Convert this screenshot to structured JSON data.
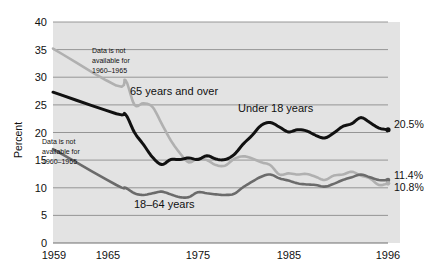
{
  "chart_data": {
    "type": "line",
    "title": "",
    "xlabel": "",
    "ylabel": "Percent",
    "xlim": [
      1959,
      1996
    ],
    "ylim": [
      0,
      40
    ],
    "ytick_step": 5,
    "grid": "horizontal",
    "legend": "inline-labels",
    "yticks": [
      "0",
      "5",
      "10",
      "15",
      "20",
      "25",
      "30",
      "35",
      "40"
    ],
    "xticks": [
      "1959",
      "1965",
      "1975",
      "1985",
      "1996"
    ],
    "colors": {
      "under18": "#111111",
      "age18to64": "#6b6b6b",
      "age65plus": "#b0b0b0",
      "plot_background": "#e3e3e3",
      "gridline": "#8c8c8c"
    },
    "series": [
      {
        "name": "Under 18 years",
        "color": "#111111",
        "end_value_label": "20.5%",
        "x": [
          1959,
          1966,
          1967,
          1968,
          1969,
          1970,
          1971,
          1972,
          1973,
          1974,
          1975,
          1976,
          1977,
          1978,
          1979,
          1980,
          1981,
          1982,
          1983,
          1984,
          1985,
          1986,
          1987,
          1988,
          1989,
          1990,
          1991,
          1992,
          1993,
          1994,
          1995,
          1996
        ],
        "values": [
          27.3,
          23.4,
          23.3,
          20.0,
          17.8,
          15.5,
          14.2,
          15.1,
          15.1,
          15.4,
          15.1,
          15.8,
          15.2,
          15.1,
          16.0,
          17.9,
          19.5,
          21.3,
          21.8,
          21.0,
          20.1,
          20.5,
          20.3,
          19.5,
          19.0,
          19.9,
          21.1,
          21.6,
          22.7,
          21.8,
          20.8,
          20.5
        ]
      },
      {
        "name": "18–64 years",
        "color": "#6b6b6b",
        "end_value_label": "11.4%",
        "x": [
          1959,
          1966,
          1967,
          1968,
          1969,
          1970,
          1971,
          1972,
          1973,
          1974,
          1975,
          1976,
          1977,
          1978,
          1979,
          1980,
          1981,
          1982,
          1983,
          1984,
          1985,
          1986,
          1987,
          1988,
          1989,
          1990,
          1991,
          1992,
          1993,
          1994,
          1995,
          1996
        ],
        "values": [
          17.0,
          10.5,
          10.0,
          9.0,
          8.7,
          9.0,
          9.3,
          8.8,
          8.3,
          8.3,
          9.2,
          9.0,
          8.8,
          8.7,
          8.9,
          10.1,
          11.1,
          12.0,
          12.4,
          11.7,
          11.3,
          10.8,
          10.6,
          10.5,
          10.2,
          10.7,
          11.4,
          11.9,
          12.4,
          11.9,
          11.4,
          11.4
        ]
      },
      {
        "name": "65 years and over",
        "color": "#b0b0b0",
        "end_value_label": "10.8%",
        "x": [
          1959,
          1966,
          1967,
          1968,
          1969,
          1970,
          1971,
          1972,
          1973,
          1974,
          1975,
          1976,
          1977,
          1978,
          1979,
          1980,
          1981,
          1982,
          1983,
          1984,
          1985,
          1986,
          1987,
          1988,
          1989,
          1990,
          1991,
          1992,
          1993,
          1994,
          1995,
          1996
        ],
        "values": [
          35.2,
          28.5,
          29.5,
          25.0,
          25.3,
          24.6,
          21.6,
          18.6,
          16.3,
          14.6,
          15.3,
          15.0,
          14.1,
          14.0,
          15.2,
          15.7,
          15.3,
          14.6,
          14.1,
          12.4,
          12.6,
          12.4,
          12.5,
          12.0,
          11.4,
          12.2,
          12.4,
          12.9,
          12.2,
          11.7,
          10.5,
          10.8
        ]
      }
    ],
    "annotations": [
      {
        "name": "note-65plus",
        "lines": [
          "Data is not",
          "available for",
          "1960–1965"
        ]
      },
      {
        "name": "note-under18",
        "lines": [
          "Data is not",
          "available for",
          "1960–1965"
        ]
      }
    ]
  }
}
